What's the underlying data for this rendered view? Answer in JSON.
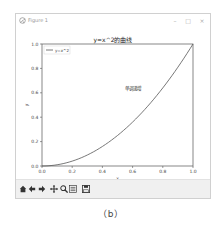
{
  "window": {
    "title": "Figure 1",
    "controls": {
      "minimize": "–",
      "maximize": "□",
      "close": "×"
    }
  },
  "chart_data": {
    "type": "line",
    "title": "y=x^2的曲线",
    "xlabel": "x",
    "ylabel": "y",
    "xlim": [
      0.0,
      1.0
    ],
    "ylim": [
      0.0,
      1.0
    ],
    "xticks": [
      "0.0",
      "0.2",
      "0.4",
      "0.6",
      "0.8",
      "1.0"
    ],
    "yticks": [
      "0.0",
      "0.2",
      "0.4",
      "0.6",
      "0.8",
      "1.0"
    ],
    "grid": false,
    "legend_position": "upper left",
    "series": [
      {
        "name": "y=x^2",
        "x": [
          0.0,
          0.1,
          0.2,
          0.3,
          0.4,
          0.5,
          0.6,
          0.7,
          0.8,
          0.9,
          1.0
        ],
        "values": [
          0.0,
          0.01,
          0.04,
          0.09,
          0.16,
          0.25,
          0.36,
          0.49,
          0.64,
          0.81,
          1.0
        ]
      }
    ],
    "annotations": [
      {
        "text": "单调递增",
        "x": 0.6,
        "y": 0.62
      }
    ]
  },
  "toolbar": {
    "buttons": [
      {
        "name": "home",
        "icon": "home-icon"
      },
      {
        "name": "back",
        "icon": "arrow-left-icon"
      },
      {
        "name": "forward",
        "icon": "arrow-right-icon"
      },
      {
        "name": "pan",
        "icon": "move-icon"
      },
      {
        "name": "zoom",
        "icon": "magnifier-icon"
      },
      {
        "name": "configure-subplots",
        "icon": "sliders-icon"
      },
      {
        "name": "save",
        "icon": "floppy-icon"
      }
    ]
  },
  "caption": "（b）"
}
